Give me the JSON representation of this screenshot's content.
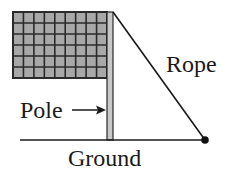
{
  "diagram": {
    "labels": {
      "rope": "Rope",
      "pole": "Pole",
      "ground": "Ground"
    },
    "flag": {
      "columns": 9,
      "rows": 6,
      "fill": "#a8a8a8",
      "grid_color": "#2a2a2a"
    },
    "colors": {
      "line": "#1a1a1a",
      "pole_fill": "#c8c8c8"
    }
  }
}
